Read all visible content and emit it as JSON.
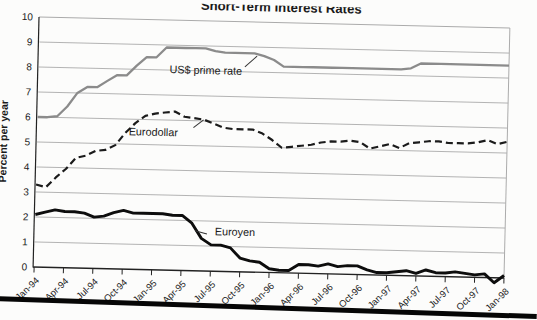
{
  "page": {
    "background": "#fcfcfb"
  },
  "chart_data": {
    "type": "line",
    "title": "Short-Term Interest Rates",
    "xlabel": "",
    "ylabel": "Percent per year",
    "ylim": [
      0,
      10
    ],
    "ytick_step": 1,
    "y_tick_labels": [
      "0",
      "1",
      "2",
      "3",
      "4",
      "5",
      "6",
      "7",
      "8",
      "9",
      "10"
    ],
    "grid": "horizontal",
    "legend": "inline-labels-with-leader-lines",
    "x_unit": "monthly observations, Jan-94 through Jan-98",
    "x_tick_labels": [
      "Jan-94",
      "Apr-94",
      "Jul-94",
      "Oct-94",
      "Jan-95",
      "Apr-95",
      "Jul-95",
      "Oct-95",
      "Jan-96",
      "Apr-96",
      "Jul-96",
      "Oct-96",
      "Jan-97",
      "Apr-97",
      "Jul-97",
      "Oct-97",
      "Jan-98"
    ],
    "colors": {
      "background": "#fcfcfb",
      "grid": "#ababab",
      "frame": "#ababab",
      "axis": "#222222",
      "text": "#1a1a1a",
      "prime": "#8b8b8b",
      "eurodollar": "#1b1b1b",
      "euroyen": "#0d0d0d",
      "leader": "#333333",
      "bottom_rule": "#060606"
    },
    "series": [
      {
        "name": "US$ prime rate",
        "style": "solid",
        "color_key": "prime",
        "stroke_width": 2.3,
        "values": [
          6.0,
          6.0,
          6.05,
          6.45,
          7.0,
          7.25,
          7.25,
          7.5,
          7.75,
          7.75,
          8.15,
          8.5,
          8.5,
          8.9,
          8.9,
          8.9,
          8.9,
          8.9,
          8.8,
          8.75,
          8.75,
          8.75,
          8.75,
          8.65,
          8.5,
          8.25,
          8.25,
          8.25,
          8.25,
          8.25,
          8.25,
          8.25,
          8.25,
          8.25,
          8.25,
          8.25,
          8.25,
          8.25,
          8.3,
          8.5,
          8.5,
          8.5,
          8.5,
          8.5,
          8.5,
          8.5,
          8.5,
          8.5,
          8.5
        ]
      },
      {
        "name": "Eurodollar",
        "style": "dashed",
        "color_key": "eurodollar",
        "stroke_width": 2.2,
        "values": [
          3.3,
          3.2,
          3.6,
          3.95,
          4.4,
          4.5,
          4.7,
          4.75,
          4.95,
          5.45,
          5.85,
          6.15,
          6.25,
          6.3,
          6.35,
          6.15,
          6.1,
          6.05,
          5.9,
          5.75,
          5.7,
          5.7,
          5.7,
          5.55,
          5.3,
          5.0,
          5.05,
          5.1,
          5.15,
          5.25,
          5.3,
          5.3,
          5.35,
          5.3,
          5.05,
          5.15,
          5.25,
          5.1,
          5.3,
          5.35,
          5.4,
          5.4,
          5.35,
          5.35,
          5.35,
          5.4,
          5.5,
          5.35,
          5.45
        ]
      },
      {
        "name": "Euroyen",
        "style": "solid",
        "color_key": "euroyen",
        "stroke_width": 2.9,
        "values": [
          2.1,
          2.2,
          2.3,
          2.25,
          2.25,
          2.2,
          2.05,
          2.1,
          2.25,
          2.35,
          2.25,
          2.25,
          2.25,
          2.25,
          2.2,
          2.2,
          1.9,
          1.3,
          1.05,
          1.05,
          0.95,
          0.55,
          0.45,
          0.4,
          0.15,
          0.1,
          0.1,
          0.35,
          0.35,
          0.3,
          0.4,
          0.3,
          0.35,
          0.35,
          0.2,
          0.1,
          0.1,
          0.15,
          0.2,
          0.1,
          0.25,
          0.15,
          0.15,
          0.2,
          0.15,
          0.1,
          0.15,
          -0.2,
          0.1
        ]
      }
    ]
  }
}
